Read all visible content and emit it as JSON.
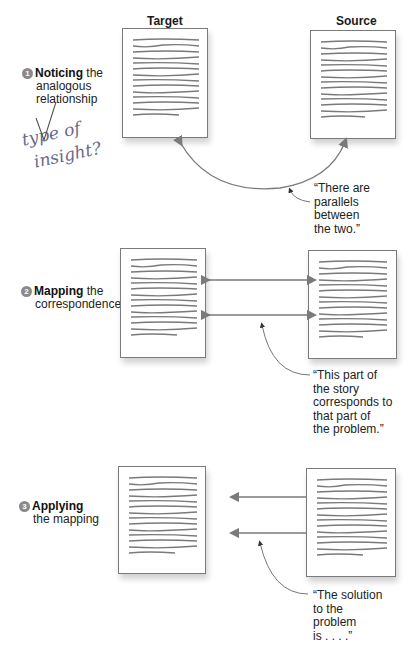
{
  "columns": {
    "target": "Target",
    "source": "Source"
  },
  "steps": [
    {
      "number": "1",
      "bold": "Noticing",
      "rest_line1": " the",
      "line2": "analogous",
      "line3": "relationship"
    },
    {
      "number": "2",
      "bold": "Mapping",
      "rest_line1": " the",
      "line2": "correspondence",
      "line3": ""
    },
    {
      "number": "3",
      "bold": "Applying",
      "rest_line1": "",
      "line2": "the mapping",
      "line3": ""
    }
  ],
  "quotes": [
    {
      "lines": [
        "“There are",
        "parallels",
        "between",
        "the two.”"
      ]
    },
    {
      "lines": [
        "“This part of",
        "the story",
        "corresponds to",
        "that part of",
        "the problem.”"
      ]
    },
    {
      "lines": [
        "“The solution",
        "to the",
        "problem",
        "is . . . .”"
      ]
    }
  ],
  "handwritten_note": {
    "line1": "type of",
    "line2": "insight?",
    "mark": "√"
  },
  "icons": {
    "document": "document-text-icon",
    "arrow": "arrow-icon",
    "number_badge": "circled-number-icon"
  },
  "colors": {
    "line": "#7a7a7a",
    "doc_border": "#7a7a7a",
    "text": "#222222",
    "badge": "#8a8a8a"
  }
}
